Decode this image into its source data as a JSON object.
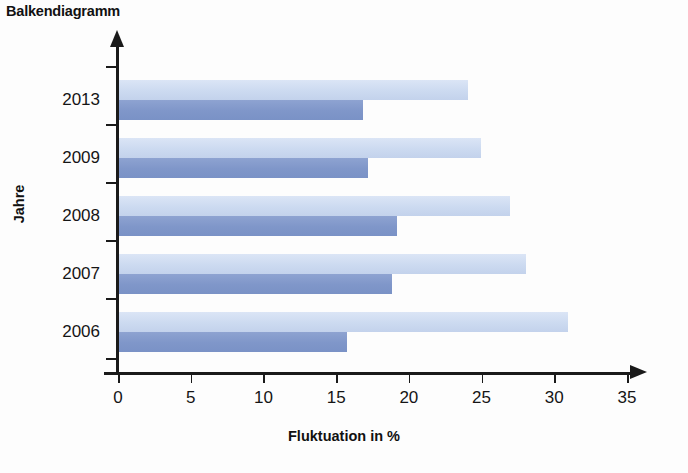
{
  "chart_data": {
    "type": "bar",
    "orientation": "horizontal",
    "title": "Balkendiagramm",
    "xlabel": "Fluktuation in %",
    "ylabel": "Jahre",
    "categories": [
      "2013",
      "2009",
      "2008",
      "2007",
      "2006"
    ],
    "series": [
      {
        "name": "light",
        "color": "#ccdaf0",
        "values": [
          24.0,
          24.9,
          26.9,
          28.0,
          30.9
        ]
      },
      {
        "name": "dark",
        "color": "#7f96c9",
        "values": [
          16.8,
          17.1,
          19.1,
          18.8,
          15.7
        ]
      }
    ],
    "xlim": [
      0,
      35
    ],
    "xticks": [
      0,
      5,
      10,
      15,
      20,
      25,
      30,
      35
    ],
    "xtick_labels": [
      "0",
      "5",
      "10",
      "15",
      "20",
      "25",
      "30",
      "35"
    ],
    "grid": false,
    "legend": "none",
    "axis_color": "#1a1a1a",
    "background": "#fdfdfd"
  }
}
